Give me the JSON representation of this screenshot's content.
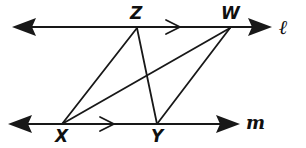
{
  "figure": {
    "type": "geometry-diagram",
    "stroke_color": "#181818",
    "background_color": "#ffffff",
    "width": 306,
    "height": 148
  },
  "lines": [
    {
      "id": "line-l",
      "label": "ℓ",
      "label_x": 279,
      "label_y": 17,
      "y": 27,
      "x_start": 12,
      "x_end": 272,
      "arrow_left": true,
      "arrow_right": true,
      "tick_marks": 1,
      "tick_x": 172
    },
    {
      "id": "line-m",
      "label": "m",
      "label_x": 246,
      "label_y": 114,
      "y": 124,
      "x_start": 12,
      "x_end": 240,
      "arrow_left": true,
      "arrow_right": true,
      "tick_marks": 1,
      "tick_x": 106
    }
  ],
  "points": [
    {
      "id": "Z",
      "label": "Z",
      "x": 137,
      "y": 28,
      "label_x": 130,
      "label_y": 5
    },
    {
      "id": "W",
      "label": "W",
      "x": 230,
      "y": 28,
      "label_x": 221,
      "label_y": 5
    },
    {
      "id": "X",
      "label": "X",
      "x": 62,
      "y": 124,
      "label_x": 55,
      "label_y": 128
    },
    {
      "id": "Y",
      "label": "Y",
      "x": 157,
      "y": 124,
      "label_x": 151,
      "label_y": 128
    }
  ],
  "segments": [
    {
      "id": "seg-XZ",
      "from": "X",
      "to": "Z",
      "x1": 62,
      "y1": 124,
      "x2": 137,
      "y2": 28
    },
    {
      "id": "seg-XW",
      "from": "X",
      "to": "W",
      "x1": 62,
      "y1": 124,
      "x2": 230,
      "y2": 28
    },
    {
      "id": "seg-ZY",
      "from": "Z",
      "to": "Y",
      "x1": 137,
      "y1": 28,
      "x2": 157,
      "y2": 124
    },
    {
      "id": "seg-YW",
      "from": "Y",
      "to": "W",
      "x1": 157,
      "y1": 124,
      "x2": 230,
      "y2": 28
    }
  ]
}
